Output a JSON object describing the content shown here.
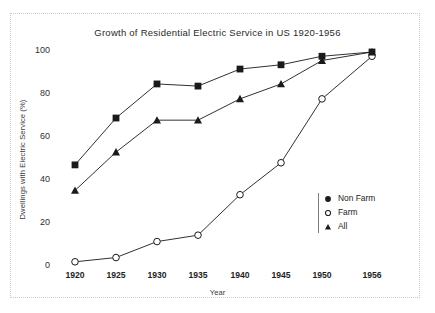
{
  "chart_data": {
    "type": "line",
    "title": "Growth of Residential Electric Service in US 1920-1956",
    "xlabel": "Year",
    "ylabel": "Dwellings with Electric Service (%)",
    "categories": [
      "1920",
      "1925",
      "1930",
      "1935",
      "1940",
      "1945",
      "1950",
      "1956"
    ],
    "x": [
      1920,
      1925,
      1930,
      1935,
      1940,
      1945,
      1950,
      1956
    ],
    "xtick_labels": [
      "1920",
      "1925",
      "1930",
      "1935",
      "1940",
      "1945",
      "1950",
      "1956"
    ],
    "ytick_labels": [
      "0",
      "20",
      "40",
      "60",
      "80",
      "100"
    ],
    "yticks": [
      0,
      20,
      40,
      60,
      80,
      100
    ],
    "ylim": [
      0,
      100
    ],
    "grid": false,
    "legend_position": "right-inside",
    "series": [
      {
        "name": "Non Farm",
        "marker": "filled-square",
        "color": "#1a1a1a",
        "values": [
          47,
          69,
          85,
          84,
          92,
          94,
          98,
          100
        ]
      },
      {
        "name": "Farm",
        "marker": "open-circle",
        "color": "#1a1a1a",
        "values": [
          1.5,
          3.5,
          11,
          14,
          33,
          48,
          78,
          98
        ]
      },
      {
        "name": "All",
        "marker": "filled-triangle",
        "color": "#1a1a1a",
        "values": [
          35,
          53,
          68,
          68,
          78,
          85,
          96,
          100
        ]
      }
    ]
  },
  "legend": {
    "items": [
      {
        "label": "Non Farm",
        "marker": "filled-circle"
      },
      {
        "label": "Farm",
        "marker": "open-circle"
      },
      {
        "label": "All",
        "marker": "filled-triangle"
      }
    ]
  }
}
